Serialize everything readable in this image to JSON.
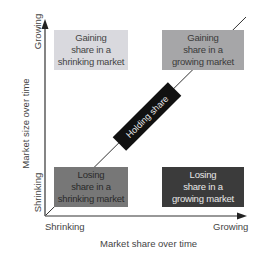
{
  "diagram": {
    "type": "2x2 matrix",
    "x_axis": {
      "title": "Market share over time",
      "min_label": "Shrinking",
      "max_label": "Growing"
    },
    "y_axis": {
      "title": "Market size over time",
      "min_label": "Shrinking",
      "max_label": "Growing"
    },
    "quadrants": [
      {
        "id": "top-left",
        "lines": [
          "Gaining",
          "share in a",
          "shrinking market"
        ],
        "fill": "#d9d9de",
        "text_color": "#444444"
      },
      {
        "id": "top-right",
        "lines": [
          "Gaining",
          "share in a",
          "growing market"
        ],
        "fill": "#a6a6a8",
        "text_color": "#3a3a3a"
      },
      {
        "id": "bottom-left",
        "lines": [
          "Losing",
          "share in a",
          "shrinking market"
        ],
        "fill": "#777777",
        "text_color": "#2a2a2a"
      },
      {
        "id": "bottom-right",
        "lines": [
          "Losing",
          "share in a",
          "growing market"
        ],
        "fill": "#3b3b3b",
        "text_color": "#e8e8e8"
      }
    ],
    "diagonal": {
      "label": "Holding share",
      "fill": "#111111",
      "text_color": "#e6e6e6"
    },
    "colors": {
      "axis": "#333333",
      "diagonal_line": "#333333"
    }
  }
}
